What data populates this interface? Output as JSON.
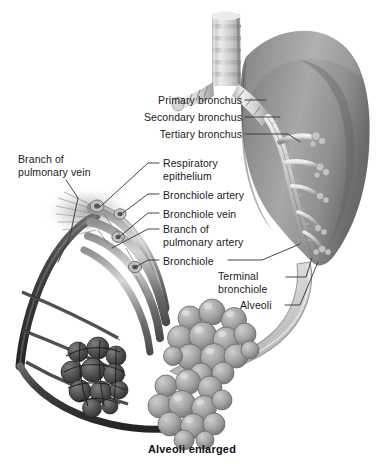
{
  "figure": {
    "background_color": "#ffffff",
    "width": 384,
    "height": 469,
    "caption": "Alveoli enlarged",
    "label_color": "#1a1a1a",
    "leader_line_color": "#3a3a3a",
    "lung_fill_color": "#9a9a9a",
    "arrow_fill_color": "#c9c9c9",
    "alveoli_fill_color": "#a5a5a5",
    "vessel_dark_color": "#4a4a4a"
  },
  "labels": [
    {
      "id": "primary-bronchus",
      "text": "Primary bronchus",
      "align": "right",
      "x": 138,
      "y": 94,
      "width": 104,
      "leader": "from right edge of text horizontally to the upper bronchus"
    },
    {
      "id": "secondary-bronchus",
      "text": "Secondary bronchus",
      "align": "right",
      "x": 124,
      "y": 111,
      "width": 118,
      "leader": "from right edge of text horizontally to the secondary bronchus"
    },
    {
      "id": "tertiary-bronchus",
      "text": "Tertiary bronchus",
      "align": "right",
      "x": 138,
      "y": 128,
      "width": 104,
      "leader": "from right edge of text to the tertiary branch inside lung"
    },
    {
      "id": "branch-of-pulmonary-vein",
      "text": "Branch of\npulmonary vein",
      "align": "left",
      "x": 18,
      "y": 153,
      "width": 92,
      "leader": "down-right from text to the pulmonary vein trunk"
    },
    {
      "id": "respiratory-epithelium",
      "text": "Respiratory\nepithelium",
      "align": "left",
      "x": 163,
      "y": 157,
      "width": 78,
      "leader": "left and down to epithelium of bronchiole wall"
    },
    {
      "id": "bronchiole-artery",
      "text": "Bronchiole artery",
      "align": "left",
      "x": 163,
      "y": 189,
      "width": 96,
      "leader": "left and down to small artery on bronchiole"
    },
    {
      "id": "bronchiole-vein",
      "text": "Bronchiole vein",
      "align": "left",
      "x": 163,
      "y": 208,
      "width": 88,
      "leader": "left and down to small vein on bronchiole"
    },
    {
      "id": "branch-of-pulmonary-artery",
      "text": "Branch of\npulmonary artery",
      "align": "left",
      "x": 163,
      "y": 223,
      "width": 100,
      "leader": "left and down to pulmonary artery branch"
    },
    {
      "id": "bronchiole",
      "text": "Bronchiole",
      "align": "left",
      "x": 163,
      "y": 255,
      "width": 62,
      "leader": "left to bronchiole tube; also a line right toward the lung"
    },
    {
      "id": "terminal-bronchiole",
      "text": "Terminal\nbronchiole",
      "align": "left",
      "x": 218,
      "y": 270,
      "width": 66,
      "leader": "right and up into the lung base"
    },
    {
      "id": "alveoli",
      "text": "Alveoli",
      "align": "left",
      "x": 240,
      "y": 299,
      "width": 42,
      "leader": "right and up into the lung base alveolar cluster"
    }
  ],
  "anatomy_parts": [
    {
      "id": "trachea",
      "name": "trachea with cartilage rings",
      "ring_count": 6
    },
    {
      "id": "carina",
      "name": "tracheal bifurcation"
    },
    {
      "id": "left-primary-bronchus",
      "name": "left primary bronchus stump"
    },
    {
      "id": "lung",
      "name": "right lung silhouette"
    },
    {
      "id": "bronchial-tree",
      "name": "intrapulmonary bronchial tree"
    },
    {
      "id": "magnify-arrow",
      "name": "curved magnification arrow"
    },
    {
      "id": "bronchiole-bundle",
      "name": "enlarged bronchiole with vessels"
    },
    {
      "id": "alveolar-cluster-upper",
      "name": "upper alveolar sac cluster"
    },
    {
      "id": "alveolar-cluster-lower",
      "name": "lower alveolar sac cluster"
    },
    {
      "id": "alveolar-cluster-capillary",
      "name": "alveolar sac covered by capillary network"
    },
    {
      "id": "pulmonary-vessels",
      "name": "pulmonary vein and artery branches"
    }
  ]
}
